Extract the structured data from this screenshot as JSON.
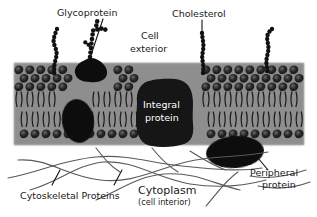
{
  "figure": {
    "background_color": "#ffffff",
    "membrane_band_color": "#8c8c8c",
    "head_color": "#2b2b2b",
    "protein_color": "#101010",
    "filament_color": "#5a5a5a"
  },
  "labels": {
    "glycoprotein": "Glycoprotein",
    "cholesterol": "Cholesterol",
    "cell_exterior_line1": "Cell",
    "cell_exterior_line2": "exterior",
    "integral_protein_line1": "Integral",
    "integral_protein_line2": "protein",
    "peripheral_protein_line1": "Peripheral",
    "peripheral_protein_line2": "protein",
    "cytoskeletal_proteins": "Cytoskeletal Proteins",
    "cytoplasm": "Cytoplasm",
    "cytoplasm_sub": "(cell interior)"
  },
  "structures": {
    "bilayer": {
      "name": "phospholipid-bilayer",
      "outer_leaflet_rows": 2,
      "inner_leaflet_rows": 1,
      "head_count_per_row": 26
    },
    "proteins": [
      {
        "name": "glycoprotein",
        "position": "upper-leaflet-left"
      },
      {
        "name": "integral-protein",
        "position": "spanning-center"
      },
      {
        "name": "partial-protein",
        "position": "inner-leaflet-left"
      },
      {
        "name": "peripheral-protein",
        "position": "cytoplasmic-right"
      }
    ],
    "cholesterol_chains": 4
  }
}
